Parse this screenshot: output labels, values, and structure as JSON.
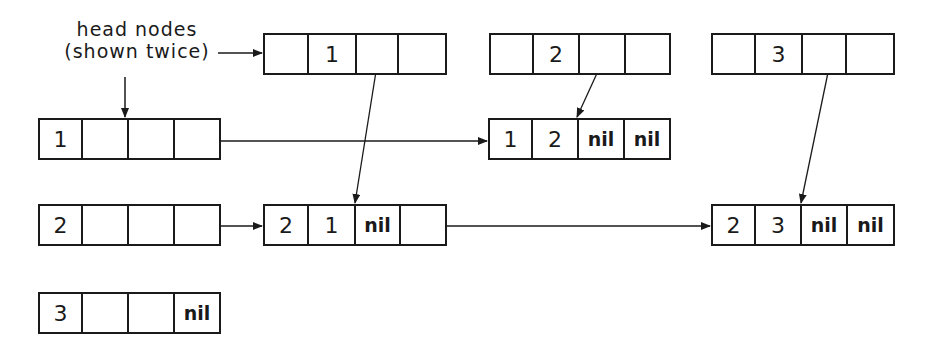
{
  "annotation": {
    "line1": "head nodes",
    "line2": "(shown twice)"
  },
  "column_heads": [
    {
      "id": "col1",
      "cells": [
        "",
        "1",
        "",
        ""
      ],
      "x": 263,
      "y": 33,
      "widths": [
        44,
        48,
        42,
        46
      ]
    },
    {
      "id": "col2",
      "cells": [
        "",
        "2",
        "",
        ""
      ],
      "x": 489,
      "y": 33,
      "widths": [
        43,
        46,
        46,
        43
      ]
    },
    {
      "id": "col3",
      "cells": [
        "",
        "3",
        "",
        ""
      ],
      "x": 711,
      "y": 33,
      "widths": [
        43,
        47,
        44,
        46
      ]
    }
  ],
  "row_heads": [
    {
      "id": "row1",
      "cells": [
        "1",
        "",
        "",
        ""
      ],
      "x": 38,
      "y": 118,
      "widths": [
        43,
        46,
        46,
        44
      ]
    },
    {
      "id": "row2",
      "cells": [
        "2",
        "",
        "",
        ""
      ],
      "x": 38,
      "y": 204,
      "widths": [
        43,
        46,
        46,
        44
      ]
    },
    {
      "id": "row3",
      "cells": [
        "3",
        "",
        "",
        "nil"
      ],
      "x": 38,
      "y": 292,
      "widths": [
        43,
        46,
        46,
        44
      ]
    }
  ],
  "element_nodes": [
    {
      "id": "e12",
      "cells": [
        "1",
        "2",
        "nil",
        "nil"
      ],
      "x": 488,
      "y": 118,
      "widths": [
        43,
        46,
        46,
        44
      ]
    },
    {
      "id": "e21",
      "cells": [
        "2",
        "1",
        "nil",
        ""
      ],
      "x": 263,
      "y": 204,
      "widths": [
        44,
        47,
        45,
        44
      ]
    },
    {
      "id": "e23",
      "cells": [
        "2",
        "3",
        "nil",
        "nil"
      ],
      "x": 711,
      "y": 204,
      "widths": [
        43,
        46,
        46,
        45
      ]
    }
  ]
}
